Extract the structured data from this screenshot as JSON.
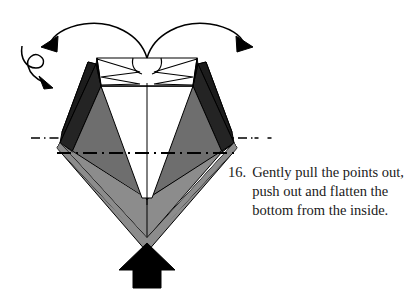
{
  "figure": {
    "kind": "origami-folding-diagram",
    "background_color": "#ffffff",
    "ink_color": "#000000",
    "palette": {
      "paper_white": "#ffffff",
      "shade_black": "#1c1c1c",
      "shade_dark_gray": "#4a4a4a",
      "shade_mid_gray": "#6e6e6e",
      "shade_light_gray": "#8c8c8c",
      "outline": "#000000"
    },
    "model": {
      "name": "diamond-base",
      "description": "Diamond shaped paper model with white top band, zigzag notches, dark and gray shaded facets and a white inner V",
      "center_x": 147,
      "top_y": 58,
      "bottom_y": 238
    },
    "annotations": {
      "center_line_vertical": "vertical-dash-line",
      "center_line_horizontal_upper": "horizontal-dash-dot-upper",
      "center_line_horizontal_lower": "horizontal-dash-dot-lower",
      "arrow_left_pull": "curved-arrow-pointing-left",
      "arrow_right_pull": "curved-arrow-pointing-right",
      "arrow_loop_small": "small-loop-arrow",
      "arrow_push_up": "solid-black-push-arrow-up"
    }
  },
  "caption": {
    "number": "16.",
    "text": "Gently pull the points out, push out and flatten the bottom from the inside.",
    "lines": [
      "Gently pull the points out,",
      "push out and flatten the",
      "bottom from the inside."
    ]
  }
}
